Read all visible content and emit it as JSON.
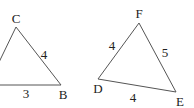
{
  "figure": {
    "triangles": [
      {
        "name": "ABC",
        "vertices": [
          {
            "label": "C",
            "x": 16,
            "y": 27,
            "lx": 16,
            "ly": 23
          },
          {
            "label": "B",
            "x": 61,
            "y": 85,
            "lx": 63,
            "ly": 99
          },
          {
            "label": "A",
            "x": -12,
            "y": 85,
            "lx": -12,
            "ly": 99
          }
        ],
        "side_labels": [
          {
            "side": "CB",
            "text": "4",
            "x": 44,
            "y": 59
          },
          {
            "side": "AB",
            "text": "3",
            "x": 26,
            "y": 98
          }
        ]
      },
      {
        "name": "DEF",
        "vertices": [
          {
            "label": "F",
            "x": 139,
            "y": 23,
            "lx": 139,
            "ly": 18
          },
          {
            "label": "D",
            "x": 98,
            "y": 79,
            "lx": 98,
            "ly": 93
          },
          {
            "label": "E",
            "x": 176,
            "y": 92,
            "lx": 180,
            "ly": 106
          }
        ],
        "side_labels": [
          {
            "side": "DF",
            "text": "4",
            "x": 112,
            "y": 50
          },
          {
            "side": "FE",
            "text": "5",
            "x": 165,
            "y": 57
          },
          {
            "side": "DE",
            "text": "4",
            "x": 133,
            "y": 102
          }
        ]
      }
    ]
  }
}
